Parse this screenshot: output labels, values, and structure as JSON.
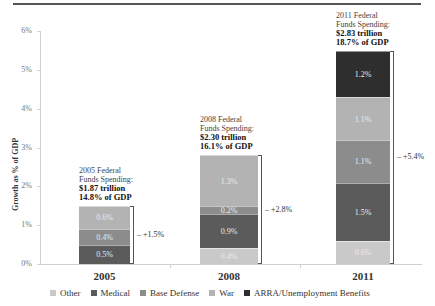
{
  "chart_data": {
    "type": "bar",
    "stacked": true,
    "title": "",
    "xlabel": "",
    "ylabel": "Growth as % of GDP",
    "ylim": [
      0,
      6
    ],
    "yticks": [
      "0%",
      "1%",
      "2%",
      "3%",
      "4%",
      "5%",
      "6%"
    ],
    "categories": [
      "2005",
      "2008",
      "2011"
    ],
    "series": [
      {
        "name": "Other",
        "color": "#c9c9c9",
        "values": [
          0,
          0.4,
          0.6
        ],
        "labels": [
          "",
          "0.4%",
          "0.6%"
        ]
      },
      {
        "name": "Medical",
        "color": "#5b5b5b",
        "values": [
          0.5,
          0.9,
          1.5
        ],
        "labels": [
          "0.5%",
          "0.9%",
          "1.5%"
        ]
      },
      {
        "name": "Base Defense",
        "color": "#8c8c8c",
        "values": [
          0.4,
          0.2,
          1.1
        ],
        "labels": [
          "0.4%",
          "0.2%",
          "1.1%"
        ]
      },
      {
        "name": "War",
        "color": "#b3b3b3",
        "values": [
          0.6,
          1.3,
          1.1
        ],
        "labels": [
          "0.6%",
          "1.3%",
          "1.1%"
        ]
      },
      {
        "name": "ARRA/Unemployment Benefits",
        "color": "#2e2e2e",
        "values": [
          0,
          0,
          1.2
        ],
        "labels": [
          "",
          "",
          "1.2%"
        ]
      }
    ],
    "totals": [
      "+1.5%",
      "+2.8%",
      "+5.4%"
    ],
    "annotations": [
      {
        "line1": "2005 Federal",
        "line2": "Funds Spending:",
        "amount": "$1.87 trillion",
        "gdp": "14.8% of GDP"
      },
      {
        "line1": "2008 Federal",
        "line2": "Funds Spending:",
        "amount": "$2.30 trillion",
        "gdp": "16.1% of GDP"
      },
      {
        "line1": "2011 Federal",
        "line2": "Funds Spending:",
        "amount": "$2.83 trillion",
        "gdp": "18.7% of GDP"
      }
    ],
    "legend_position": "bottom",
    "grid": false
  }
}
